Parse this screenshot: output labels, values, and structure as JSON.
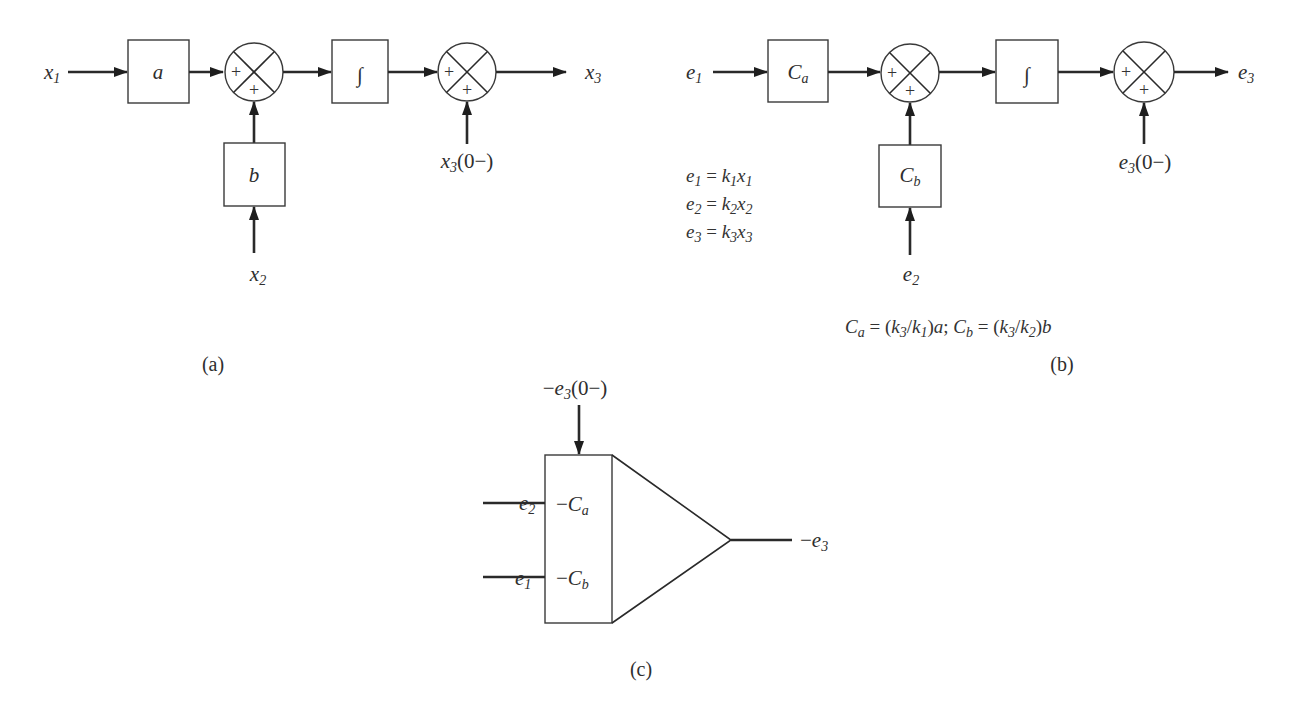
{
  "diagram": {
    "panel_a": {
      "caption": "(a)",
      "input_x1": {
        "base": "x",
        "sub": "1"
      },
      "input_x2": {
        "base": "x",
        "sub": "2"
      },
      "gain_a": "a",
      "gain_b": "b",
      "integrator": "∫",
      "sum1_signs": [
        "+",
        "+"
      ],
      "sum2_signs": [
        "+",
        "+"
      ],
      "initial_condition": {
        "base": "x",
        "sub": "3",
        "tail": "(0−)"
      },
      "output_x3": {
        "base": "x",
        "sub": "3"
      }
    },
    "panel_b": {
      "caption": "(b)",
      "input_e1": {
        "base": "e",
        "sub": "1"
      },
      "input_e2": {
        "base": "e",
        "sub": "2"
      },
      "gain_Ca": {
        "base": "C",
        "sub": "a"
      },
      "gain_Cb": {
        "base": "C",
        "sub": "b"
      },
      "integrator": "∫",
      "sum1_signs": [
        "+",
        "+"
      ],
      "sum2_signs": [
        "+",
        "+"
      ],
      "initial_condition": {
        "base": "e",
        "sub": "3",
        "tail": "(0−)"
      },
      "output_e3": {
        "base": "e",
        "sub": "3"
      },
      "equations": [
        {
          "lhs": "e",
          "lhs_sub": "1",
          "op": " = ",
          "k": "k",
          "k_sub": "1",
          "x": "x",
          "x_sub": "1"
        },
        {
          "lhs": "e",
          "lhs_sub": "2",
          "op": " = ",
          "k": "k",
          "k_sub": "2",
          "x": "x",
          "x_sub": "2"
        },
        {
          "lhs": "e",
          "lhs_sub": "3",
          "op": " = ",
          "k": "k",
          "k_sub": "3",
          "x": "x",
          "x_sub": "3"
        }
      ],
      "scaling_note": {
        "ca": "C",
        "ca_sub": "a",
        "eq1": " = (",
        "k3": "k",
        "k3_sub": "3",
        "slash1": "/",
        "k1": "k",
        "k1_sub": "1",
        "close1": ")",
        "a": "a",
        "sep": "; ",
        "cb": "C",
        "cb_sub": "b",
        "eq2": " = (",
        "k3b": "k",
        "k3b_sub": "3",
        "slash2": "/",
        "k2": "k",
        "k2_sub": "2",
        "close2": ")",
        "b": "b"
      }
    },
    "panel_c": {
      "caption": "(c)",
      "initial_condition": {
        "prefix": "−",
        "base": "e",
        "sub": "3",
        "tail": "(0−)"
      },
      "input_top": {
        "base": "e",
        "sub": "2"
      },
      "input_bottom": {
        "base": "e",
        "sub": "1"
      },
      "gain_top": {
        "prefix": "−",
        "base": "C",
        "sub": "a"
      },
      "gain_bottom": {
        "prefix": "−",
        "base": "C",
        "sub": "b"
      },
      "output": {
        "prefix": "−",
        "base": "e",
        "sub": "3"
      }
    }
  }
}
